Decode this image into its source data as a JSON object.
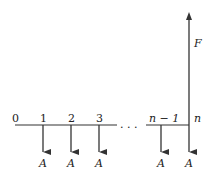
{
  "diagram": {
    "type": "cash-flow-diagram",
    "period_labels": [
      "0",
      "1",
      "2",
      "3",
      "n − 1",
      "n"
    ],
    "ellipsis": ". . .",
    "payment_label": "A",
    "future_value_label": "F",
    "payments": [
      {
        "period": "1",
        "label": "A",
        "direction": "down"
      },
      {
        "period": "2",
        "label": "A",
        "direction": "down"
      },
      {
        "period": "3",
        "label": "A",
        "direction": "down"
      },
      {
        "period": "n − 1",
        "label": "A",
        "direction": "down"
      },
      {
        "period": "n",
        "label": "A",
        "direction": "down"
      }
    ],
    "receipt": {
      "period": "n",
      "label": "F",
      "direction": "up"
    },
    "colors": {
      "line": "#333333",
      "text": "#222222"
    }
  }
}
